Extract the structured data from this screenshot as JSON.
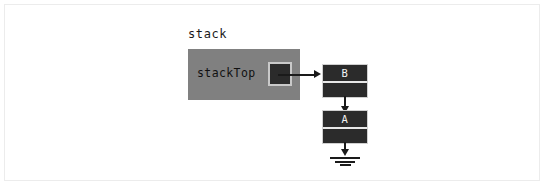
{
  "diagram": {
    "title": "stack",
    "type": "linked-list-stack",
    "colors": {
      "background": "#ffffff",
      "frame": "#ececec",
      "stack_box_fill": "#808080",
      "node_fill": "#2b2b2b",
      "node_border": "#d0d0d0",
      "arrow": "#1a1a1a",
      "node_text": "#f2f2f2",
      "label_text": "#1a1a1a"
    },
    "stack_object": {
      "caption": "stack",
      "field_label": "stackTop",
      "pointer_slot_name": "stackTop-pointer"
    },
    "nodes": [
      {
        "data": "B",
        "link_target": "A"
      },
      {
        "data": "A",
        "link_target": "null"
      }
    ],
    "terminator": {
      "symbol": "ground-icon",
      "meaning": "null",
      "bars": 3
    },
    "arrows": [
      {
        "from": "stackTop",
        "to": "B",
        "direction": "right"
      },
      {
        "from": "B",
        "to": "A",
        "direction": "down"
      },
      {
        "from": "A",
        "to": "null",
        "direction": "down"
      }
    ]
  }
}
